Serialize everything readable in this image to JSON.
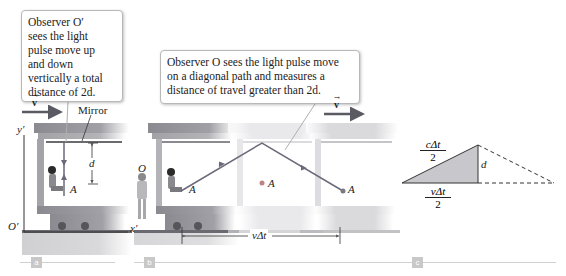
{
  "panel_a": {
    "tag": "a",
    "callout_lines": [
      "Observer O′",
      "sees the light",
      "pulse move up",
      "and down",
      "vertically a total",
      "distance of 2d."
    ],
    "velocity_label": "v",
    "mirror_label": "Mirror",
    "y_axis_label": "y′",
    "x_axis_label": "x′",
    "origin_label": "O′",
    "distance_label": "d",
    "point_label": "A"
  },
  "panel_b": {
    "tag": "b",
    "callout_lines": [
      "Observer O sees the light pulse move",
      "on a diagonal path and measures a",
      "distance of travel greater than 2d."
    ],
    "velocity_label": "v",
    "observer_label": "O",
    "point_labels": [
      "A",
      "A",
      "A"
    ],
    "displacement_label": "vΔt"
  },
  "panel_c": {
    "tag": "c",
    "hypotenuse_label_num": "cΔt",
    "hypotenuse_label_den": "2",
    "base_label_num": "vΔt",
    "base_label_den": "2",
    "height_label": "d"
  },
  "colors": {
    "path": "#6a6a7a",
    "train_dark": "#7a7a80",
    "train_faded": "#d8d8dc",
    "triangle_fill": "#c8c8cc",
    "arrow": "#5a5a62"
  }
}
